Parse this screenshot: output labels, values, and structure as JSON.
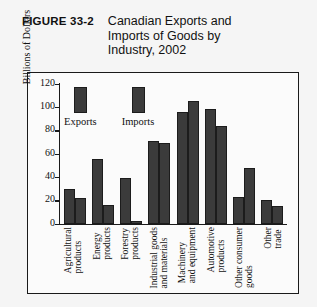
{
  "figure": {
    "label": "FIGURE 33-2",
    "title": "Canadian Exports and Imports of Goods by Industry, 2002"
  },
  "chart_data": {
    "type": "bar",
    "title": "Canadian Exports and Imports of Goods by Industry, 2002",
    "xlabel": "",
    "ylabel": "Billions of Dollars",
    "ylim": [
      0,
      120
    ],
    "yticks": [
      0,
      20,
      40,
      60,
      80,
      100,
      120
    ],
    "grid": false,
    "legend_position": "inside-upper-left",
    "categories": [
      "Agricultural products",
      "Energy products",
      "Forestry products",
      "Industrial goods and materials",
      "Machinery and equipment",
      "Automotive products",
      "Other consumer goods",
      "Other trade"
    ],
    "categories_lines": [
      [
        "Agricultural",
        "products"
      ],
      [
        "Energy",
        "products"
      ],
      [
        "Forestry",
        "products"
      ],
      [
        "Industrial goods",
        "and materials"
      ],
      [
        "Machinery",
        "and equipment"
      ],
      [
        "Automotive",
        "products"
      ],
      [
        "Other consumer",
        "goods"
      ],
      [
        "Other",
        "trade"
      ]
    ],
    "series": [
      {
        "name": "Exports",
        "color": "#3b3b3b",
        "values": [
          30,
          55,
          39,
          71,
          96,
          98,
          23,
          20
        ]
      },
      {
        "name": "Imports",
        "color": "#3b3b3b",
        "values": [
          22,
          16,
          2,
          69,
          105,
          84,
          48,
          15
        ]
      }
    ]
  }
}
